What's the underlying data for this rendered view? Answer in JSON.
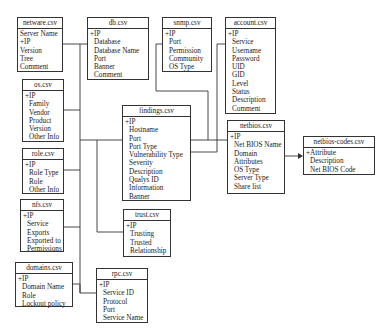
{
  "diagram": {
    "type": "entity-relationship",
    "tables": {
      "netware": {
        "name": "netware.csv",
        "fields": [
          "Server Name",
          "+IP",
          "Version",
          "Tree",
          "Comment"
        ]
      },
      "db": {
        "name": "db.csv",
        "fields": [
          "+IP",
          "Database",
          "Database Name",
          "Port",
          "Banner",
          "Comment"
        ]
      },
      "snmp": {
        "name": "snmp.csv",
        "fields": [
          "+IP",
          "Port",
          "Permission",
          "Community",
          "OS Type"
        ]
      },
      "account": {
        "name": "account.csv",
        "fields": [
          "+IP",
          "Service",
          "Username",
          "Password",
          "UID",
          "GID",
          "Level",
          "Status",
          "Description",
          "Comment"
        ]
      },
      "os": {
        "name": "os.csv",
        "fields": [
          "+IP",
          "Family",
          "Vendor",
          "Product",
          "Version",
          "Other Info"
        ]
      },
      "findings": {
        "name": "findings.csv",
        "fields": [
          "+IP",
          "Hostname",
          "Port",
          "Port Type",
          "Vulnerability Type",
          "Severity",
          "Description",
          "Qualys ID",
          "Information",
          "Banner"
        ]
      },
      "netbios": {
        "name": "netbios.csv",
        "fields": [
          "+IP",
          "Net BIOS Name",
          "Domain",
          "Attributes",
          "OS Type",
          "Server Type",
          "Share list"
        ]
      },
      "netbios_codes": {
        "name": "netbios-codes.csv",
        "fields": [
          "+Attribute",
          "Description",
          "Net BIOS Code"
        ]
      },
      "role": {
        "name": "role.csv",
        "fields": [
          "+IP",
          "Role Type",
          "Role",
          "Other Info"
        ]
      },
      "nfs": {
        "name": "nfs.csv",
        "fields": [
          "+IP",
          "Service",
          "Exports",
          "Exported to",
          "Permissions"
        ]
      },
      "trust": {
        "name": "trust.csv",
        "fields": [
          "+IP",
          "Trusting",
          "Trusted",
          "Relationship"
        ]
      },
      "domains": {
        "name": "domains.csv",
        "fields": [
          "+IP",
          "Domain Name",
          "Role",
          "Lockout policy"
        ]
      },
      "rpc": {
        "name": "rpc.csv",
        "fields": [
          "+IP",
          "Service ID",
          "Protocol",
          "Port",
          "Service Name"
        ]
      }
    },
    "relationships": [
      {
        "from": "netware",
        "to": "findings"
      },
      {
        "from": "db",
        "to": "findings"
      },
      {
        "from": "os",
        "to": "findings"
      },
      {
        "from": "role",
        "to": "findings"
      },
      {
        "from": "nfs",
        "to": "findings"
      },
      {
        "from": "domains",
        "to": "findings"
      },
      {
        "from": "rpc",
        "to": "findings"
      },
      {
        "from": "trust",
        "to": "findings"
      },
      {
        "from": "snmp",
        "to": "findings"
      },
      {
        "from": "account",
        "to": "findings"
      },
      {
        "from": "findings",
        "to": "netbios"
      },
      {
        "from": "netbios",
        "to": "netbios_codes",
        "arrow": true
      }
    ],
    "colors": {
      "line": "#333333",
      "background": "#ffffff",
      "text": "#1a1a1a"
    }
  }
}
